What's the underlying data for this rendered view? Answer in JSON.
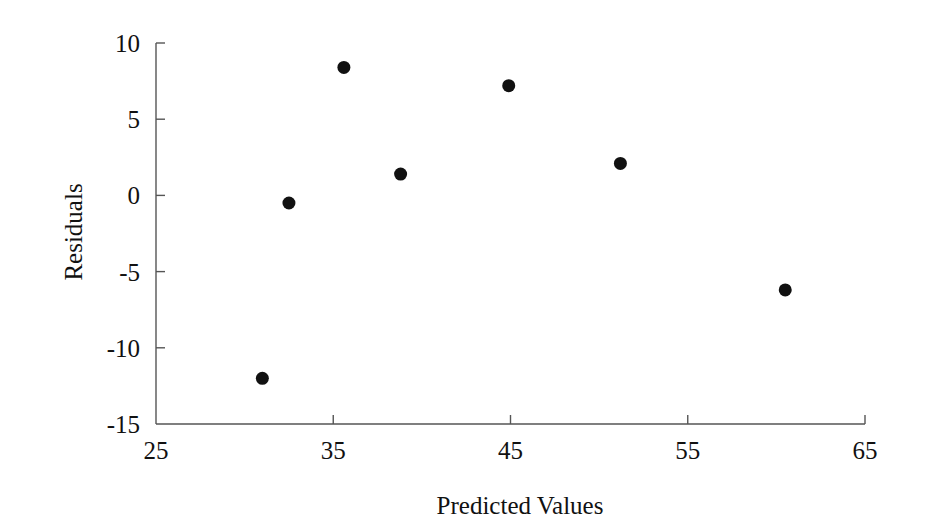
{
  "chart_data": {
    "type": "scatter",
    "title": "",
    "xlabel": "Predicted Values",
    "ylabel": "Residuals",
    "xlim": [
      25,
      65
    ],
    "ylim": [
      -15,
      10
    ],
    "xticks": [
      25,
      35,
      45,
      55,
      65
    ],
    "yticks": [
      10,
      5,
      0,
      -5,
      -10,
      -15
    ],
    "xtick_labels": [
      "25",
      "35",
      "45",
      "55",
      "65"
    ],
    "ytick_labels": [
      "10",
      "5",
      "0",
      "-5",
      "-10",
      "-15"
    ],
    "grid": false,
    "legend": false,
    "marker": "filled-circle",
    "marker_color": "#111111",
    "marker_size_px": 13,
    "axis_color": "#555555",
    "background_color": "#ffffff",
    "points": [
      {
        "x": 31.0,
        "y": -12.0
      },
      {
        "x": 32.5,
        "y": -0.5
      },
      {
        "x": 35.6,
        "y": 8.4
      },
      {
        "x": 38.8,
        "y": 1.4
      },
      {
        "x": 44.9,
        "y": 7.2
      },
      {
        "x": 51.2,
        "y": 2.1
      },
      {
        "x": 60.5,
        "y": -6.2
      }
    ]
  },
  "geometry": {
    "plot_left_px": 156,
    "plot_right_px": 865,
    "plot_top_px": 43,
    "plot_bottom_px": 424,
    "x_title_x_px": 520,
    "x_title_y_px": 492,
    "y_title_x_px": 74,
    "y_title_y_px": 232
  }
}
